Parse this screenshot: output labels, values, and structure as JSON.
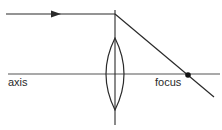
{
  "diagram": {
    "type": "converging lens ray diagram",
    "labels": {
      "axis": "axis",
      "focus": "focus"
    },
    "colors": {
      "line": "#2a2a2a",
      "axis_line": "#555555",
      "focus_dot": "#111111",
      "background": "#ffffff"
    },
    "elements": [
      {
        "name": "incident-ray",
        "description": "horizontal ray parallel to axis travelling right with arrowhead"
      },
      {
        "name": "lens",
        "description": "biconvex (converging) lens"
      },
      {
        "name": "lens-plane",
        "description": "vertical line through lens centre"
      },
      {
        "name": "principal-axis",
        "description": "horizontal optical axis"
      },
      {
        "name": "refracted-ray",
        "description": "ray bent at lens passing through focus"
      },
      {
        "name": "focal-point",
        "description": "dot marking the focus on the axis"
      }
    ]
  }
}
